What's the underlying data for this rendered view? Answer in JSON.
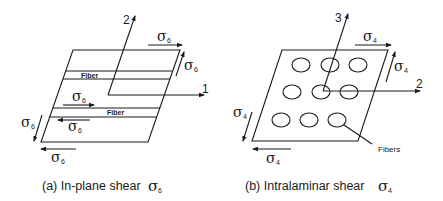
{
  "panel_a": {
    "caption_prefix": "(a) In-plane shear ",
    "caption_symbol": "σ",
    "caption_sub": "6",
    "axis_1_label": "1",
    "axis_2_label": "2",
    "fiber_label_1": "Fiber",
    "fiber_label_2": "Fiber",
    "stress_symbol": "σ",
    "stress_sub": "6"
  },
  "panel_b": {
    "caption_prefix": "(b) Intralaminar shear ",
    "caption_symbol": "σ",
    "caption_sub": "4",
    "axis_2_label": "2",
    "axis_3_label": "3",
    "fibers_label": "Fibers",
    "stress_symbol": "σ",
    "stress_sub": "4"
  },
  "colors": {
    "line": "#1a1a1a",
    "background": "#ffffff"
  }
}
